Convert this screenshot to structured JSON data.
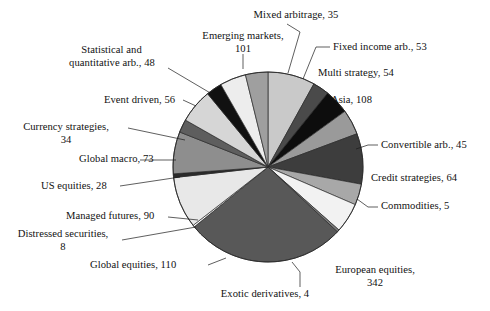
{
  "chart_data": {
    "type": "pie",
    "title": "",
    "subtitle": "",
    "xlabel": "",
    "ylabel": "",
    "legend_position": "none",
    "grid": false,
    "total": 1258,
    "value_unit": "funds",
    "start_angle_deg": 0,
    "direction": "clockwise",
    "categories": [
      "Emerging markets",
      "Mixed arbitrage",
      "Fixed income arb.",
      "Multi strategy",
      "Asia",
      "Convertible arb.",
      "Credit strategies",
      "Commodities",
      "European equities",
      "Exotic derivatives",
      "Global equities",
      "Distressed securities",
      "Managed futures",
      "US equities",
      "Global macro",
      "Currency strategies",
      "Event driven",
      "Statistical and quantitative arb."
    ],
    "values": [
      101,
      35,
      53,
      54,
      108,
      45,
      64,
      5,
      342,
      4,
      110,
      8,
      90,
      28,
      73,
      34,
      56,
      48
    ],
    "colors": [
      "#c9c9c9",
      "#4a4a4a",
      "#0d0d0d",
      "#9a9a9a",
      "#3d3d3d",
      "#a8a8a8",
      "#f2f2f2",
      "#7d7d7d",
      "#585858",
      "#ffffff",
      "#e8e8e8",
      "#2b2b2b",
      "#8e8e8e",
      "#5e5e5e",
      "#d6d6d6",
      "#111111",
      "#ededed",
      "#9f9f9f"
    ],
    "slices": [
      {
        "label": "Emerging markets",
        "value": 101,
        "color": "#c9c9c9"
      },
      {
        "label": "Mixed arbitrage",
        "value": 35,
        "color": "#4a4a4a"
      },
      {
        "label": "Fixed income arb.",
        "value": 53,
        "color": "#0d0d0d"
      },
      {
        "label": "Multi strategy",
        "value": 54,
        "color": "#9a9a9a"
      },
      {
        "label": "Asia",
        "value": 108,
        "color": "#3d3d3d"
      },
      {
        "label": "Convertible arb.",
        "value": 45,
        "color": "#a8a8a8"
      },
      {
        "label": "Credit strategies",
        "value": 64,
        "color": "#f2f2f2"
      },
      {
        "label": "Commodities",
        "value": 5,
        "color": "#7d7d7d"
      },
      {
        "label": "European equities",
        "value": 342,
        "color": "#585858"
      },
      {
        "label": "Exotic derivatives",
        "value": 4,
        "color": "#ffffff"
      },
      {
        "label": "Global equities",
        "value": 110,
        "color": "#e8e8e8"
      },
      {
        "label": "Distressed securities",
        "value": 8,
        "color": "#2b2b2b"
      },
      {
        "label": "Managed futures",
        "value": 90,
        "color": "#8e8e8e"
      },
      {
        "label": "US equities",
        "value": 28,
        "color": "#5e5e5e"
      },
      {
        "label": "Global macro",
        "value": 73,
        "color": "#d6d6d6"
      },
      {
        "label": "Currency strategies",
        "value": 34,
        "color": "#111111"
      },
      {
        "label": "Event driven",
        "value": 56,
        "color": "#ededed"
      },
      {
        "label": "Statistical and quantitative arb.",
        "value": 48,
        "color": "#9f9f9f"
      }
    ]
  },
  "labels": {
    "mixed_arbitrage": "Mixed arbitrage, 35",
    "emerging_markets_line1": "Emerging markets,",
    "emerging_markets_line2": "101",
    "fixed_income_arb": "Fixed income arb., 53",
    "multi_strategy": "Multi strategy, 54",
    "asia": "Asia, 108",
    "convertible_arb": "Convertible arb., 45",
    "credit_strategies": "Credit strategies, 64",
    "commodities": "Commodities, 5",
    "european_equities_line1": "European equities,",
    "european_equities_line2": "342",
    "exotic_derivatives": "Exotic derivatives, 4",
    "global_equities": "Global equities, 110",
    "distressed_securities_line1": "Distressed securities,",
    "distressed_securities_line2": "8",
    "managed_futures": "Managed futures, 90",
    "us_equities": "US equities, 28",
    "global_macro": "Global macro, 73",
    "currency_strategies_line1": "Currency strategies,",
    "currency_strategies_line2": "34",
    "event_driven": "Event driven, 56",
    "statistical_arb_line1": "Statistical and",
    "statistical_arb_line2": "quantitative arb., 48"
  }
}
